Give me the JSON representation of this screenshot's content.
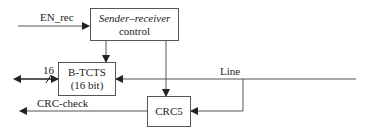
{
  "blocks": {
    "sender_receiver": {
      "line1": "Sender–receiver",
      "line2": "control"
    },
    "btcts": {
      "line1": "B-TCTS",
      "line2": "(16 bit)"
    },
    "crc5": {
      "line1": "CRC5"
    }
  },
  "signals": {
    "en_rec": "EN_rec",
    "bus_width": "16",
    "line": "Line",
    "crc_check": "CRC-check"
  },
  "colors": {
    "stroke": "#555555",
    "text": "#222222",
    "background": "#ffffff"
  }
}
